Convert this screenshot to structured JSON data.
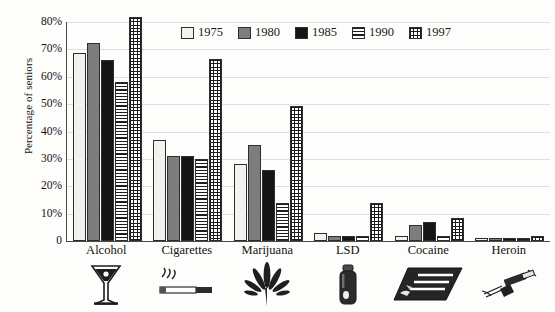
{
  "axis": {
    "y_title": "Percentage of seniors",
    "y_ticks": [
      "80%",
      "70%",
      "60%",
      "50%",
      "40%",
      "30%",
      "20%",
      "10%",
      "0"
    ]
  },
  "legend": {
    "items": [
      {
        "label": "1975",
        "pattern": "solid-white"
      },
      {
        "label": "1980",
        "pattern": "solid-gray"
      },
      {
        "label": "1985",
        "pattern": "solid-black"
      },
      {
        "label": "1990",
        "pattern": "horizontal-lines"
      },
      {
        "label": "1997",
        "pattern": "cross-hatch"
      }
    ]
  },
  "icons": [
    {
      "name": "martini-glass-icon",
      "category": "Alcohol"
    },
    {
      "name": "cigarette-icon",
      "category": "Cigarettes"
    },
    {
      "name": "cannabis-leaf-icon",
      "category": "Marijuana"
    },
    {
      "name": "vial-bottle-icon",
      "category": "LSD"
    },
    {
      "name": "powder-lines-mirror-icon",
      "category": "Cocaine"
    },
    {
      "name": "syringe-icon",
      "category": "Heroin"
    }
  ],
  "chart_data": {
    "type": "bar",
    "title": "",
    "xlabel": "",
    "ylabel": "Percentage of seniors",
    "ylim": [
      0,
      80
    ],
    "grid": true,
    "legend_position": "top-center",
    "categories": [
      "Alcohol",
      "Cigarettes",
      "Marijuana",
      "LSD",
      "Cocaine",
      "Heroin"
    ],
    "series": [
      {
        "name": "1975",
        "values": [
          68.5,
          37,
          28,
          3,
          2,
          1
        ]
      },
      {
        "name": "1980",
        "values": [
          72.5,
          31,
          35,
          2,
          6,
          1
        ]
      },
      {
        "name": "1985",
        "values": [
          66,
          31,
          26,
          2,
          7,
          1
        ]
      },
      {
        "name": "1990",
        "values": [
          58,
          30,
          14,
          2,
          2,
          1
        ]
      },
      {
        "name": "1997",
        "values": [
          82,
          66.5,
          49.5,
          14,
          8.5,
          2
        ]
      }
    ]
  }
}
